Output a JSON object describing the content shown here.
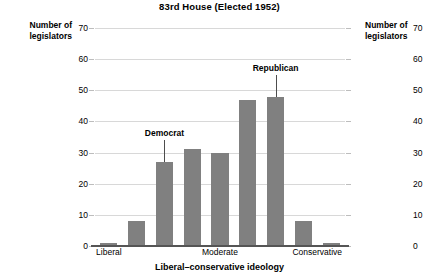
{
  "chart_data": {
    "type": "bar",
    "title": "83rd House (Elected 1952)",
    "xlabel": "Liberal–conservative ideology",
    "ylabel": "Number of legislators",
    "ylabel_right": "Number of legislators",
    "ylim": [
      0,
      70
    ],
    "yticks": [
      0,
      10,
      20,
      30,
      40,
      50,
      60,
      70
    ],
    "ytick_labels": [
      "0",
      "10",
      "20",
      "30",
      "40",
      "50",
      "60",
      "70"
    ],
    "ytick_labels_right": [
      "0",
      "10",
      "20",
      "30",
      "40",
      "50",
      "60",
      "70"
    ],
    "grid": true,
    "legend": "none",
    "xtick_labels": [
      "Liberal",
      "Moderate",
      "Conservative"
    ],
    "xtick_positions": [
      0.5,
      4.5,
      8.0
    ],
    "categories": [
      "1",
      "2",
      "3",
      "4",
      "5",
      "6",
      "7",
      "8",
      "9"
    ],
    "values": [
      1,
      8,
      27,
      31,
      30,
      47,
      48,
      8,
      1
    ],
    "bar_color": "#808080",
    "grid_color": "#d8d8d8",
    "axis_color": "#555555",
    "annotations": [
      {
        "text": "Democrat",
        "points_to_index": 2,
        "value": 27
      },
      {
        "text": "Republican",
        "points_to_index": 6,
        "value": 48
      }
    ]
  },
  "chart": {
    "title": "83rd House (Elected 1952)",
    "left_axis_title_line1": "Number of",
    "left_axis_title_line2": "legislators",
    "right_axis_title_line1": "Number of",
    "right_axis_title_line2": "legislators",
    "xaxis_title": "Liberal–conservative ideology",
    "xticks": [
      {
        "label": "Liberal"
      },
      {
        "label": "Moderate"
      },
      {
        "label": "Conservative"
      }
    ],
    "yticks_left": [
      {
        "label": "70"
      },
      {
        "label": "60"
      },
      {
        "label": "50"
      },
      {
        "label": "40"
      },
      {
        "label": "30"
      },
      {
        "label": "20"
      },
      {
        "label": "10"
      },
      {
        "label": "0"
      }
    ],
    "yticks_right": [
      {
        "label": "70"
      },
      {
        "label": "60"
      },
      {
        "label": "50"
      },
      {
        "label": "40"
      },
      {
        "label": "30"
      },
      {
        "label": "20"
      },
      {
        "label": "10"
      },
      {
        "label": "0"
      }
    ],
    "annotations": [
      {
        "label": "Democrat"
      },
      {
        "label": "Republican"
      }
    ]
  }
}
